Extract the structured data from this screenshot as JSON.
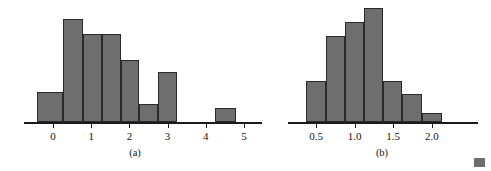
{
  "figure": {
    "background_color": "#ffffff",
    "bar_fill_color": "#6e6e6e",
    "bar_edge_color": "#2a2a2a",
    "axis_color": "#1a1a1a",
    "corner_mark_label": "color-swatch"
  },
  "panels": [
    {
      "id": "a",
      "caption": "(a)",
      "caption_x": 135,
      "axis": {
        "left_px": 24,
        "right_px": 262,
        "baseline_px": 122,
        "origin_px": 53,
        "unit_px": 38.2
      },
      "chart_data": {
        "type": "bar",
        "title": "",
        "xlabel": "",
        "ylabel": "",
        "grid": false,
        "legend": "none",
        "bin_width": 0.5,
        "bin_edges": [
          -0.34,
          0.16,
          0.66,
          1.16,
          1.66,
          2.16,
          2.66,
          3.16,
          3.66,
          4.16,
          4.66
        ],
        "tick_labels": [
          "0",
          "1",
          "2",
          "3",
          "4",
          "5"
        ],
        "tick_values": [
          0,
          1,
          2,
          3,
          4,
          5
        ],
        "xlim": [
          -0.76,
          5.47
        ],
        "ylim": [
          0,
          108
        ],
        "categories": [
          "-0.34",
          "0.16",
          "0.66",
          "1.16",
          "1.66",
          "2.16",
          "2.66",
          "3.16",
          "3.66",
          "4.16"
        ],
        "values": [
          30,
          103,
          88,
          88,
          62,
          18,
          50,
          0,
          0,
          14
        ]
      },
      "bars": [
        {
          "x": 37,
          "width": 26,
          "height": 30
        },
        {
          "x": 63,
          "width": 20,
          "height": 103
        },
        {
          "x": 83,
          "width": 19,
          "height": 88
        },
        {
          "x": 102,
          "width": 19,
          "height": 88
        },
        {
          "x": 121,
          "width": 18,
          "height": 62
        },
        {
          "x": 139,
          "width": 19,
          "height": 18
        },
        {
          "x": 158,
          "width": 19,
          "height": 50
        },
        {
          "x": 215,
          "width": 21,
          "height": 14
        }
      ]
    },
    {
      "id": "b",
      "caption": "(b)",
      "caption_x": 112,
      "axis": {
        "left_px": 18,
        "right_px": 208,
        "baseline_px": 122,
        "origin_px": 46,
        "unit_px": 77.2
      },
      "chart_data": {
        "type": "bar",
        "title": "",
        "xlabel": "",
        "ylabel": "",
        "grid": false,
        "legend": "none",
        "bin_width": 0.25,
        "bin_edges": [
          0.37,
          0.62,
          0.87,
          1.12,
          1.37,
          1.62,
          1.87,
          2.12
        ],
        "tick_labels": [
          "0.5",
          "1.0",
          "1.5",
          "2.0"
        ],
        "tick_values": [
          0.5,
          1.0,
          1.5,
          2.0
        ],
        "xlim": [
          0.24,
          2.5
        ],
        "ylim": [
          0,
          114
        ],
        "categories": [
          "0.37",
          "0.62",
          "0.87",
          "1.12",
          "1.37",
          "1.62",
          "1.87"
        ],
        "values": [
          41,
          86,
          100,
          114,
          41,
          28,
          9
        ]
      },
      "bars": [
        {
          "x": 36,
          "width": 20,
          "height": 41
        },
        {
          "x": 56,
          "width": 19,
          "height": 86
        },
        {
          "x": 75,
          "width": 19,
          "height": 100
        },
        {
          "x": 94,
          "width": 19,
          "height": 114
        },
        {
          "x": 113,
          "width": 19,
          "height": 41
        },
        {
          "x": 132,
          "width": 20,
          "height": 28
        },
        {
          "x": 152,
          "width": 20,
          "height": 9
        }
      ]
    }
  ]
}
